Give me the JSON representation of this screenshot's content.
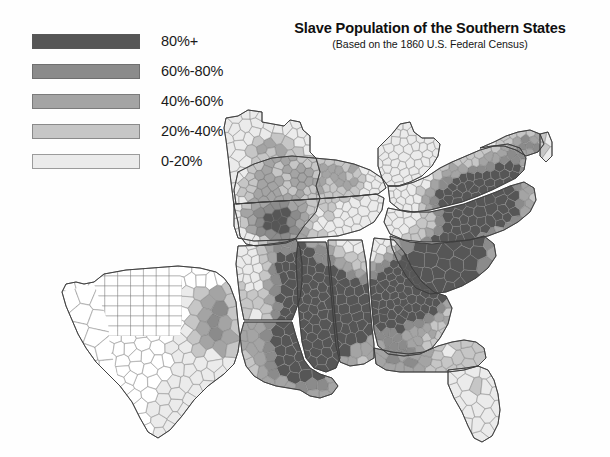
{
  "title": {
    "main": "Slave Population of the Southern States",
    "subtitle": "(Based on the 1860 U.S. Federal Census)"
  },
  "legend": {
    "items": [
      {
        "label": "80%+",
        "color": "#565656",
        "min": 80,
        "max": 100
      },
      {
        "label": "60%-80%",
        "color": "#8b8b8b",
        "min": 60,
        "max": 80
      },
      {
        "label": "40%-60%",
        "color": "#a4a4a4",
        "min": 40,
        "max": 60
      },
      {
        "label": "20%-40%",
        "color": "#c6c6c6",
        "min": 20,
        "max": 40
      },
      {
        "label": "0-20%",
        "color": "#ebebeb",
        "min": 0,
        "max": 20
      }
    ],
    "no_data_color": "#ffffff"
  },
  "map": {
    "projection_note": "Southern United States, county level choropleth",
    "background": "#fefefe",
    "border_color": "#6e6e6e",
    "chart_data": {
      "type": "map",
      "title": "Slave Population of the Southern States",
      "subtitle": "(Based on the 1860 U.S. Federal Census)",
      "value_unit": "percent of total population enslaved",
      "bins": [
        "0-20%",
        "20%-40%",
        "40%-60%",
        "60%-80%",
        "80%+"
      ],
      "bin_colors": [
        "#ebebeb",
        "#c6c6c6",
        "#a4a4a4",
        "#8b8b8b",
        "#565656"
      ],
      "legend_position": "top-left",
      "regions": [
        {
          "name": "Missouri",
          "dominant_bin": "0-20%",
          "note": "mostly light; Little Dixie along Missouri River darker"
        },
        {
          "name": "Kentucky",
          "dominant_bin": "20%-40%",
          "note": "Bluegrass and western counties darker, Appalachian east light"
        },
        {
          "name": "Tennessee",
          "dominant_bin": "20%-40%",
          "note": "west Tennessee dark, east Tennessee light"
        },
        {
          "name": "Virginia",
          "dominant_bin": "40%-60%",
          "note": "Tidewater and Southside dark, western mountains light"
        },
        {
          "name": "West Virginia",
          "dominant_bin": "0-20%",
          "note": "uniformly light"
        },
        {
          "name": "Maryland",
          "dominant_bin": "20%-40%",
          "note": "Eastern Shore and southern counties darker"
        },
        {
          "name": "Delaware",
          "dominant_bin": "0-20%",
          "note": "very light"
        },
        {
          "name": "North Carolina",
          "dominant_bin": "20%-40%",
          "note": "coastal plain dark, mountains light"
        },
        {
          "name": "South Carolina",
          "dominant_bin": "60%-80%",
          "note": "low country heavily enslaved, 80%+ belt"
        },
        {
          "name": "Georgia",
          "dominant_bin": "40%-60%",
          "note": "black belt across center, north Georgia light"
        },
        {
          "name": "Florida",
          "dominant_bin": "20%-40%",
          "note": "panhandle dark, peninsula light"
        },
        {
          "name": "Alabama",
          "dominant_bin": "40%-60%",
          "note": "black belt dark, hill country light"
        },
        {
          "name": "Mississippi",
          "dominant_bin": "60%-80%",
          "note": "Delta counties 80%+"
        },
        {
          "name": "Louisiana",
          "dominant_bin": "60%-80%",
          "note": "river parishes 80%+"
        },
        {
          "name": "Arkansas",
          "dominant_bin": "20%-40%",
          "note": "Delta east dark, Ozarks light"
        },
        {
          "name": "Texas",
          "dominant_bin": "0-20%",
          "note": "east Texas darker; western counties unorganized / no data (white)"
        }
      ],
      "highest_density_area": "Mississippi River Delta (Mississippi and Louisiana river counties) at 80%+",
      "lowest_density_area": "Appalachian highlands, Ozarks, and western Texas"
    }
  }
}
